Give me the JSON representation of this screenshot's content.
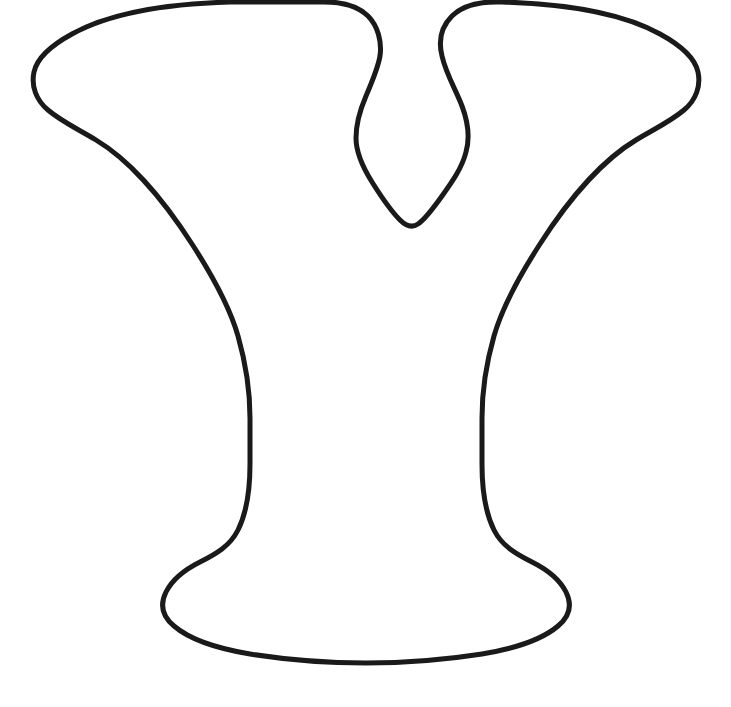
{
  "canvas": {
    "width": 731,
    "height": 707,
    "background_color": "#ffffff",
    "title": "Letter Y outline template"
  },
  "artwork": {
    "name": "letter-y-outline",
    "description": "Bold serif capital letter Y rendered as a single closed outline drawing on a plain white background",
    "character": "Y",
    "style": "outline",
    "fill_color": "#ffffff",
    "stroke_color": "#1a1a1a",
    "stroke_width": 5,
    "bounds": {
      "left": 33,
      "top": 48,
      "right": 697,
      "bottom": 663
    },
    "path": "M 232 52 C 300 46 360 52 395 72 C 418 86 426 102 428 122 C 430 140 424 152 418 162 C 412 172 409 182 412 192 C 416 205 430 218 440 232 C 452 248 460 266 460 286 C 460 312 448 332 430 345 C 412 358 396 372 388 390 C 380 406 378 424 378 444 L 378 556 C 378 580 382 596 394 608 C 406 620 424 628 442 640 C 462 653 472 668 470 684 C 468 700 452 712 428 718 C 398 726 352 730 300 730 C 248 730 202 726 172 718 C 148 712 132 700 130 684 C 128 668 138 653 158 640 C 176 628 194 620 206 608 C 218 596 222 580 222 556 L 222 444 C 222 424 220 406 212 390 C 204 372 188 358 170 345 C 152 332 140 312 140 286 C 140 266 148 248 160 232 C 170 218 184 205 188 192 C 191 182 188 172 182 162 C 176 152 170 140 172 122 C 174 102 182 86 205 72 C 240 52 300 46 232 52 Z"
  },
  "shape_outline": {
    "comment": "Explicit outline geometry of the Y glyph in image pixel coordinates, traced clockwise starting at the top-left of the left arm",
    "points_summary": [
      {
        "name": "left-arm-top-left-corner",
        "x": 38,
        "y": 95
      },
      {
        "name": "left-arm-top-edge",
        "x": 230,
        "y": 50
      },
      {
        "name": "left-arm-inner-top",
        "x": 370,
        "y": 88
      },
      {
        "name": "notch-left-waist",
        "x": 360,
        "y": 150
      },
      {
        "name": "notch-bottom-vertex",
        "x": 415,
        "y": 230
      },
      {
        "name": "notch-right-waist",
        "x": 468,
        "y": 150
      },
      {
        "name": "right-arm-inner-top",
        "x": 460,
        "y": 88
      },
      {
        "name": "right-arm-top-edge",
        "x": 560,
        "y": 50
      },
      {
        "name": "right-arm-top-right-corner",
        "x": 695,
        "y": 95
      },
      {
        "name": "right-arm-bottom-right",
        "x": 660,
        "y": 150
      },
      {
        "name": "stem-right-upper",
        "x": 470,
        "y": 330
      },
      {
        "name": "stem-right-waist",
        "x": 455,
        "y": 450
      },
      {
        "name": "foot-right-flare",
        "x": 520,
        "y": 600
      },
      {
        "name": "foot-bottom-center",
        "x": 360,
        "y": 662
      },
      {
        "name": "foot-left-flare",
        "x": 172,
        "y": 600
      },
      {
        "name": "stem-left-waist",
        "x": 248,
        "y": 450
      },
      {
        "name": "stem-left-upper",
        "x": 238,
        "y": 330
      },
      {
        "name": "left-arm-bottom-left",
        "x": 90,
        "y": 150
      }
    ]
  }
}
